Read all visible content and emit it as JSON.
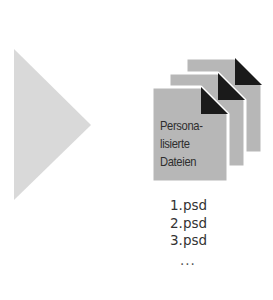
{
  "diagram": {
    "arrow": {
      "shape": "triangle-right",
      "color": "#d9d9d9"
    },
    "documents": {
      "count": 3,
      "fill": "#b7b7b7",
      "fold_color": "#1a1a1a",
      "label_lines": [
        "Persona-",
        "lisierte",
        "Dateien"
      ]
    },
    "files": [
      "1.psd",
      "2.psd",
      "3.psd"
    ],
    "ellipsis": "..."
  }
}
